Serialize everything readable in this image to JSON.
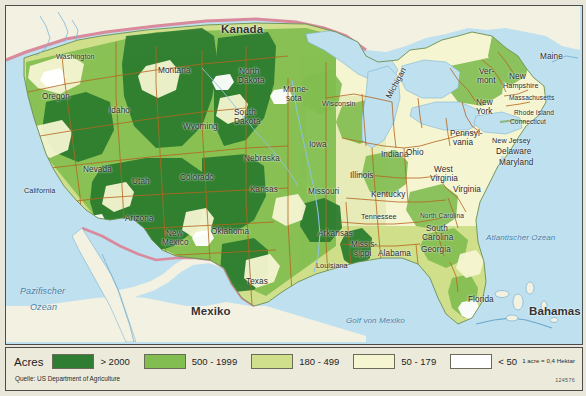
{
  "map": {
    "title_countries": [
      {
        "name": "Kanada",
        "x": 215,
        "y": 18
      },
      {
        "name": "Mexiko",
        "x": 185,
        "y": 300
      },
      {
        "name": "Bahamas",
        "x": 523,
        "y": 300
      }
    ],
    "oceans": [
      {
        "name": "Pazifischer",
        "x": 14,
        "y": 281
      },
      {
        "name": "Ozean",
        "x": 24,
        "y": 297
      },
      {
        "name": "Atlantischer Ozean",
        "x": 480,
        "y": 228
      },
      {
        "name": "Golf von Mexiko",
        "x": 340,
        "y": 311
      }
    ],
    "states": [
      {
        "name": "Washington",
        "x": 50,
        "y": 47
      },
      {
        "name": "Oregon",
        "x": 36,
        "y": 87
      },
      {
        "name": "Idaho",
        "x": 103,
        "y": 101
      },
      {
        "name": "Montana",
        "x": 152,
        "y": 61
      },
      {
        "name": "Wyoming",
        "x": 177,
        "y": 117
      },
      {
        "name": "North",
        "x": 233,
        "y": 62
      },
      {
        "name": "Dakota",
        "x": 232,
        "y": 71
      },
      {
        "name": "South",
        "x": 228,
        "y": 103
      },
      {
        "name": "Dakota",
        "x": 228,
        "y": 112
      },
      {
        "name": "Minne-",
        "x": 277,
        "y": 80
      },
      {
        "name": "sota",
        "x": 280,
        "y": 89
      },
      {
        "name": "Wisconsin",
        "x": 316,
        "y": 94
      },
      {
        "name": "Nevada",
        "x": 77,
        "y": 160
      },
      {
        "name": "California",
        "x": 18,
        "y": 181
      },
      {
        "name": "Utah",
        "x": 126,
        "y": 172
      },
      {
        "name": "Colorado",
        "x": 174,
        "y": 168
      },
      {
        "name": "Nebraska",
        "x": 238,
        "y": 149
      },
      {
        "name": "Kansas",
        "x": 244,
        "y": 180
      },
      {
        "name": "Iowa",
        "x": 303,
        "y": 135
      },
      {
        "name": "Missouri",
        "x": 302,
        "y": 182
      },
      {
        "name": "Illinois",
        "x": 344,
        "y": 166
      },
      {
        "name": "Indiana",
        "x": 375,
        "y": 145
      },
      {
        "name": "Ohio",
        "x": 400,
        "y": 143
      },
      {
        "name": "Michigan",
        "x": 383,
        "y": 88,
        "rotate": true
      },
      {
        "name": "Arizona",
        "x": 119,
        "y": 209
      },
      {
        "name": "New",
        "x": 160,
        "y": 224
      },
      {
        "name": "Mexico",
        "x": 156,
        "y": 233
      },
      {
        "name": "Oklahoma",
        "x": 205,
        "y": 222
      },
      {
        "name": "Texas",
        "x": 240,
        "y": 272
      },
      {
        "name": "Arkansas",
        "x": 312,
        "y": 224
      },
      {
        "name": "Louisiana",
        "x": 310,
        "y": 256
      },
      {
        "name": "Missis-",
        "x": 345,
        "y": 235
      },
      {
        "name": "sippi",
        "x": 348,
        "y": 244
      },
      {
        "name": "Alabama",
        "x": 372,
        "y": 244
      },
      {
        "name": "Tennessee",
        "x": 355,
        "y": 207
      },
      {
        "name": "Kentucky",
        "x": 365,
        "y": 185
      },
      {
        "name": "Georgia",
        "x": 415,
        "y": 240
      },
      {
        "name": "Florida",
        "x": 462,
        "y": 290
      },
      {
        "name": "North Carolina",
        "x": 414,
        "y": 207
      },
      {
        "name": "South",
        "x": 420,
        "y": 219
      },
      {
        "name": "Carolina",
        "x": 416,
        "y": 228
      },
      {
        "name": "West",
        "x": 428,
        "y": 160
      },
      {
        "name": "Virginia",
        "x": 424,
        "y": 169
      },
      {
        "name": "Virginia",
        "x": 447,
        "y": 180
      },
      {
        "name": "Pennsyl-",
        "x": 444,
        "y": 124
      },
      {
        "name": "vania",
        "x": 447,
        "y": 133
      },
      {
        "name": "New",
        "x": 470,
        "y": 93
      },
      {
        "name": "York",
        "x": 470,
        "y": 102
      },
      {
        "name": "New Jersey",
        "x": 486,
        "y": 131
      },
      {
        "name": "Delaware",
        "x": 490,
        "y": 142
      },
      {
        "name": "Maryland",
        "x": 493,
        "y": 153
      },
      {
        "name": "Ver-",
        "x": 473,
        "y": 62
      },
      {
        "name": "mont",
        "x": 471,
        "y": 71
      },
      {
        "name": "New",
        "x": 503,
        "y": 67
      },
      {
        "name": "Hampshire",
        "x": 497,
        "y": 76
      },
      {
        "name": "Massachusetts",
        "x": 503,
        "y": 89
      },
      {
        "name": "Rhode Island",
        "x": 508,
        "y": 104
      },
      {
        "name": "Connecticut",
        "x": 504,
        "y": 113
      },
      {
        "name": "Maine",
        "x": 534,
        "y": 47
      }
    ]
  },
  "legend": {
    "title": "Acres",
    "items": [
      {
        "label": "> 2000",
        "color": "#2f7d32"
      },
      {
        "label": "500 - 1999",
        "color": "#82bd51"
      },
      {
        "label": "180 - 499",
        "color": "#cfdf8c"
      },
      {
        "label": "50 - 179",
        "color": "#f6f5d2"
      },
      {
        "label": "< 50",
        "color": "#ffffff"
      }
    ],
    "conversion": "1 acre = 0,4 Hektar",
    "source": "Quelle: US Department of Agriculture",
    "code": "124576"
  },
  "colors": {
    "ocean": "#bfe0ef",
    "foreign_land": "#f3f1e2",
    "border_state": "#b5651d",
    "border_country": "#d4889a",
    "frame": "#4c4c4c"
  }
}
